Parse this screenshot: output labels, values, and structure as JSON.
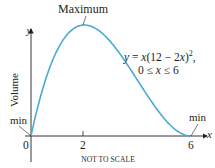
{
  "chart_data": {
    "type": "line",
    "title": "",
    "xlabel": "x",
    "ylabel": "y",
    "y_axis_title": "Volume",
    "equation_line1": "y = x(12 − 2x)²,",
    "equation_line2": "0 ≤ x ≤ 6",
    "function": "y = x(12 - 2x)^2",
    "domain": [
      0,
      6
    ],
    "x_ticks": [
      "0",
      "2",
      "6"
    ],
    "x": [
      0,
      0.5,
      1,
      1.5,
      2,
      2.5,
      3,
      3.5,
      4,
      4.5,
      5,
      5.5,
      6
    ],
    "values": [
      0,
      60.5,
      100,
      121.5,
      128,
      122.5,
      108,
      87.5,
      64,
      40.5,
      20,
      5.5,
      0
    ],
    "annotations": [
      {
        "label": "Maximum",
        "x": 2,
        "y": 128
      },
      {
        "label": "min",
        "x": 0,
        "y": 0
      },
      {
        "label": "min",
        "x": 6,
        "y": 0
      }
    ],
    "note": "NOT TO SCALE",
    "curve_color": "#4aa8d8",
    "axis_color": "#231f20",
    "grid": false,
    "legend": "none"
  },
  "labels": {
    "maximum": "Maximum",
    "y_axis": "y",
    "x_axis": "x",
    "volume": "Volume",
    "min_left": "min",
    "min_right": "min",
    "tick_0": "0",
    "tick_2": "2",
    "tick_6": "6",
    "not_to_scale": "NOT TO SCALE"
  }
}
